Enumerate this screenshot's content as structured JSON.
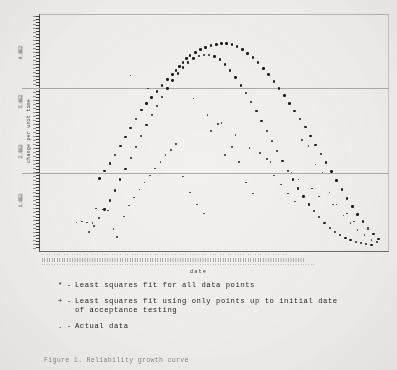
{
  "figure": {
    "xaxis_title": "date",
    "yaxis_title": "change per unit time",
    "ytick_labels": [
      "4.0E2",
      "3.0E2",
      "2.0E2",
      "1.0E2"
    ],
    "xtick_microtext_row1": "· ·· ··· ·· ···· ·· ··· ··· ···· ·· ··· ···· ·· ··· ·· ··· ···· ·· ··· ·· ·· ···· ·· ··· ·· ··· ··",
    "xtick_microtext_row2": "|||||||||||||||||||||||||||||||||||||||||||||||||||||||||||||||||||||||||||||||||||||||||||||||||||||||||",
    "xtick_microtext_row3": "·············································································································"
  },
  "legend": {
    "entries": [
      {
        "marker": "*",
        "dash": "-",
        "label": "Least squares fit for all data points",
        "continuation": ""
      },
      {
        "marker": "+",
        "dash": "-",
        "label": "Least squares fit using only points up to initial date",
        "continuation": "of acceptance testing"
      },
      {
        "marker": ".",
        "dash": "-",
        "label": "Actual data",
        "continuation": ""
      }
    ]
  },
  "caption": {
    "text": "Figure 1. Reliability growth curve"
  },
  "colors": {
    "background": "#f2f1ef",
    "ink": "#1d1c1a",
    "gridline": "#aeacaa",
    "axis": "#55534f"
  },
  "chart_data": {
    "type": "scatter",
    "title": "",
    "xlabel": "date",
    "ylabel": "change per unit time",
    "grid": true,
    "legend_position": "below-plot",
    "xlim": [
      0,
      100
    ],
    "ylim": [
      0,
      480
    ],
    "gridlines_y": [
      330,
      160
    ],
    "yticks": [
      400,
      300,
      200,
      100
    ],
    "series": [
      {
        "name": "Least squares fit for all data points",
        "marker": "*",
        "x": [
          17,
          18.5,
          20,
          21.5,
          23,
          24.5,
          26,
          27.5,
          29,
          30.5,
          32,
          33.5,
          35,
          36.5,
          38,
          39,
          40,
          41,
          42,
          43,
          44.5,
          46,
          47.5,
          49,
          50.5,
          52,
          53.5,
          55,
          56.5,
          58,
          59.5,
          61,
          62.5,
          64,
          65.5,
          67,
          68.5,
          70,
          71.5,
          73,
          74.5,
          76,
          77.5,
          79,
          80.5,
          82,
          83.5,
          85,
          86.5,
          88,
          89.5,
          91,
          92.5,
          94,
          95.5,
          97
        ],
        "y": [
          148,
          163,
          178,
          196,
          214,
          232,
          250,
          268,
          286,
          300,
          312,
          324,
          336,
          348,
          358,
          366,
          374,
          382,
          390,
          396,
          402,
          408,
          412,
          416,
          418,
          420,
          420,
          418,
          414,
          408,
          400,
          392,
          382,
          370,
          358,
          344,
          330,
          316,
          300,
          284,
          268,
          252,
          234,
          216,
          198,
          180,
          162,
          144,
          126,
          108,
          92,
          76,
          62,
          48,
          36,
          26
        ]
      },
      {
        "name": "Least squares fit using only points up to initial date of acceptance testing",
        "marker": "+",
        "x": [
          14,
          15.5,
          17,
          18.5,
          20,
          21.5,
          23,
          24.5,
          26,
          27.5,
          29,
          30.5,
          32,
          33.5,
          35,
          36.5,
          38,
          39.5,
          41,
          42.5,
          44,
          45.5,
          47,
          48.5,
          50,
          51.5,
          53,
          54.5,
          56,
          57.5,
          59,
          60.5,
          62,
          63.5,
          65,
          66.5,
          68,
          69.5,
          71,
          72.5,
          74,
          75.5,
          77,
          78.5,
          80,
          81.5,
          83,
          84.5,
          86,
          87.5,
          89,
          90.5,
          92,
          93.5,
          95
        ],
        "y": [
          40,
          52,
          68,
          86,
          104,
          124,
          146,
          168,
          190,
          212,
          234,
          256,
          276,
          294,
          312,
          330,
          346,
          360,
          372,
          382,
          390,
          396,
          398,
          398,
          394,
          388,
          378,
          366,
          352,
          336,
          320,
          302,
          284,
          264,
          244,
          224,
          204,
          184,
          164,
          146,
          128,
          112,
          96,
          82,
          70,
          58,
          48,
          40,
          34,
          28,
          24,
          20,
          18,
          16,
          14
        ]
      },
      {
        "name": "Actual data",
        "marker": ".",
        "x": [
          10.5,
          12,
          13.5,
          15,
          16,
          18,
          19.5,
          21,
          22,
          24,
          25.5,
          27,
          28.5,
          30,
          31.5,
          33,
          34.5,
          36,
          37.5,
          39,
          41,
          43,
          45,
          47,
          49,
          51,
          53,
          55,
          57,
          59,
          61,
          63,
          65,
          67,
          69,
          71,
          73,
          75,
          77,
          79,
          81,
          83,
          85,
          87,
          89,
          91,
          93,
          95,
          96.5,
          26,
          31,
          44,
          48,
          52,
          56,
          60,
          66,
          72,
          74,
          78,
          80,
          84,
          88,
          90,
          94
        ],
        "y": [
          60,
          62,
          60,
          58,
          88,
          86,
          84,
          46,
          30,
          72,
          94,
          110,
          126,
          140,
          154,
          168,
          182,
          196,
          206,
          218,
          152,
          120,
          96,
          78,
          244,
          258,
          196,
          212,
          182,
          140,
          118,
          200,
          188,
          154,
          136,
          118,
          102,
          226,
          214,
          176,
          160,
          120,
          96,
          74,
          58,
          44,
          34,
          24,
          20,
          356,
          330,
          310,
          276,
          260,
          236,
          210,
          182,
          160,
          146,
          128,
          112,
          96,
          78,
          62,
          46
        ]
      }
    ]
  }
}
